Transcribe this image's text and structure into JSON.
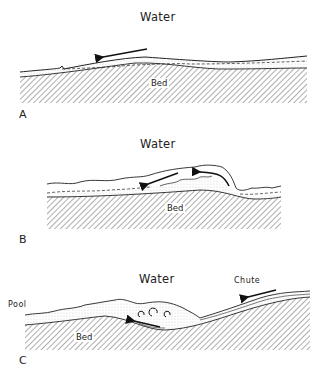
{
  "panels": [
    {
      "id": "A",
      "label": "A",
      "water_label": "Water",
      "bed_label": "Bed"
    },
    {
      "id": "B",
      "label": "B",
      "water_label": "Water",
      "bed_label": "Bed"
    },
    {
      "id": "C",
      "label": "C",
      "water_label": "Water",
      "bed_label": "Bed",
      "pool_label": "Pool",
      "chute_label": "Chute"
    }
  ],
  "colors": {
    "ink": "#222222",
    "background": "#ffffff"
  }
}
